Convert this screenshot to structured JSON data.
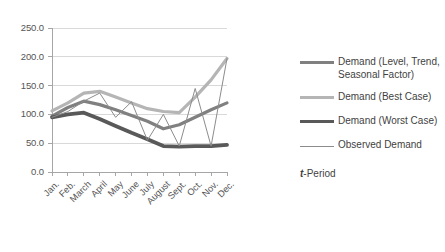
{
  "chart_data": {
    "type": "line",
    "title": "",
    "xlabel": "t-Period",
    "ylabel": "",
    "ylim": [
      0,
      250
    ],
    "ytick_step": 50,
    "grid": "horizontal",
    "legend_position": "right",
    "categories": [
      "Jan.",
      "Feb.",
      "March",
      "April",
      "May",
      "June",
      "July",
      "August",
      "Sept.",
      "Oct.",
      "Nov.",
      "Dec."
    ],
    "ytick_labels": [
      "0.0",
      "50.0",
      "100.0",
      "150.0",
      "200.0",
      "250.0"
    ],
    "series": [
      {
        "name": "Demand (Level, Trend, Seasonal Factor)",
        "color": "#808080",
        "width": 3.2,
        "values": [
          97,
          112,
          123,
          117,
          108,
          98,
          88,
          75,
          82,
          95,
          108,
          120
        ]
      },
      {
        "name": "Demand (Best Case)",
        "color": "#b5b5b5",
        "width": 3.2,
        "values": [
          106,
          120,
          137,
          140,
          130,
          120,
          110,
          105,
          103,
          130,
          160,
          197
        ]
      },
      {
        "name": "Demand (Worst Case)",
        "color": "#595959",
        "width": 3.8,
        "values": [
          95,
          100,
          103,
          92,
          80,
          68,
          57,
          45,
          44,
          45,
          45,
          47
        ]
      },
      {
        "name": "Observed Demand",
        "color": "#8c8c8c",
        "width": 1.0,
        "values": [
          95,
          105,
          123,
          137,
          95,
          122,
          55,
          100,
          45,
          145,
          45,
          197
        ]
      }
    ]
  },
  "legend": {
    "items": [
      {
        "label": "Demand (Level, Trend, Seasonal Factor)"
      },
      {
        "label": "Demand (Best Case)"
      },
      {
        "label": "Demand (Worst Case)"
      },
      {
        "label": "Observed Demand"
      }
    ]
  },
  "axis": {
    "x_title_emphasis": "t",
    "x_title_rest": "-Period"
  }
}
